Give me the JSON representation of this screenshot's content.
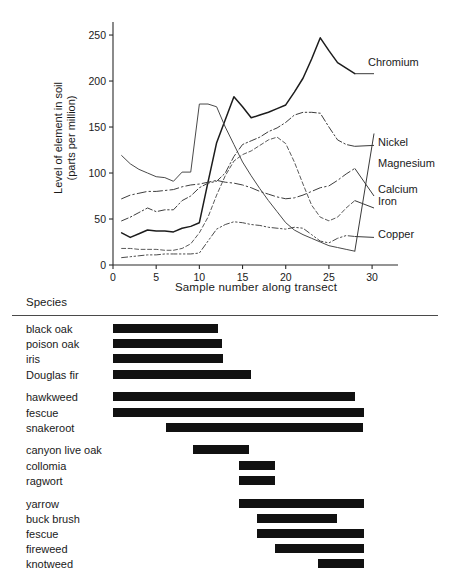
{
  "chart_data": [
    {
      "type": "line",
      "title": "",
      "xlabel": "Sample  number along transect",
      "ylabel": "Level of element in soil (parts per million)",
      "ylabel_line1": "Level of element in soil",
      "ylabel_line2": "(parts per million)",
      "xlim": [
        0,
        33
      ],
      "ylim": [
        0,
        262
      ],
      "xticks": [
        0,
        5,
        10,
        15,
        20,
        25,
        30
      ],
      "yticks": [
        0,
        50,
        100,
        150,
        200,
        250
      ],
      "grid": false,
      "legend_position": "right-inline-labels",
      "x": [
        1,
        2,
        3,
        4,
        5,
        6,
        7,
        8,
        9,
        10,
        11,
        12,
        13,
        14,
        15,
        16,
        17,
        18,
        19,
        20,
        21,
        22,
        23,
        24,
        25,
        26,
        27,
        28
      ],
      "series": [
        {
          "name": "Chromium",
          "line_style": "solid",
          "label_x": 28,
          "label_y": 208,
          "values": [
            35,
            30,
            34,
            38,
            37,
            37,
            36,
            40,
            42,
            46,
            90,
            133,
            158,
            183,
            172,
            160,
            163,
            166,
            170,
            174,
            188,
            203,
            224,
            247,
            233,
            220,
            214,
            208
          ]
        },
        {
          "name": "Nickel",
          "line_style": "solid",
          "label_x": 28,
          "label_y": 143,
          "values": [
            119,
            110,
            104,
            100,
            96,
            95,
            91,
            101,
            101,
            175,
            175,
            172,
            150,
            131,
            112,
            97,
            83,
            70,
            58,
            46,
            38,
            33,
            29,
            25,
            21,
            19,
            17,
            15
          ]
        },
        {
          "name": "Magnesium",
          "line_style": "dash-dot",
          "label_x": 28,
          "label_y": 130,
          "values": [
            48,
            52,
            57,
            62,
            58,
            60,
            60,
            70,
            75,
            84,
            89,
            91,
            100,
            118,
            131,
            135,
            139,
            145,
            149,
            155,
            163,
            166,
            166,
            165,
            150,
            136,
            131,
            129
          ]
        },
        {
          "name": "Calcium",
          "line_style": "long-dash-dot",
          "label_x": 28,
          "label_y": 75,
          "values": [
            72,
            76,
            78,
            80,
            80,
            81,
            82,
            85,
            87,
            88,
            90,
            92,
            90,
            89,
            87,
            84,
            80,
            77,
            74,
            72,
            73,
            76,
            80,
            84,
            86,
            92,
            99,
            105
          ]
        },
        {
          "name": "Iron",
          "line_style": "dashed",
          "label_x": 28,
          "label_y": 62,
          "values": [
            18,
            18,
            17,
            17,
            17,
            16,
            16,
            18,
            23,
            35,
            52,
            76,
            97,
            113,
            120,
            124,
            130,
            136,
            139,
            132,
            112,
            88,
            65,
            52,
            48,
            52,
            62,
            70
          ]
        },
        {
          "name": "Copper",
          "line_style": "dash-dot-dot",
          "label_x": 28,
          "label_y": 30,
          "values": [
            8,
            9,
            10,
            11,
            11,
            12,
            12,
            12,
            12,
            13,
            26,
            39,
            44,
            47,
            46,
            44,
            43,
            41,
            40,
            39,
            41,
            40,
            33,
            26,
            24,
            29,
            32,
            31
          ]
        }
      ]
    },
    {
      "type": "bar",
      "orientation": "horizontal-range",
      "title": "Species",
      "xlabel": "",
      "ylabel": "",
      "xlim": [
        0,
        33
      ],
      "note": "Each bar spans the sample-number range along the transect where the species occurs.",
      "categories": [
        "black oak",
        "poison oak",
        "iris",
        "Douglas fir",
        "hawkweed",
        "fescue",
        "snakeroot",
        "canyon live oak",
        "collomia",
        "ragwort",
        "yarrow",
        "buck brush",
        "fescue",
        "fireweed",
        "knotweed"
      ],
      "ranges": [
        [
          0.0,
          12.2
        ],
        [
          0.0,
          12.6
        ],
        [
          0.0,
          12.7
        ],
        [
          0.0,
          16.0
        ],
        [
          0.0,
          28.0
        ],
        [
          0.0,
          29.0
        ],
        [
          6.1,
          29.0
        ],
        [
          9.2,
          15.7
        ],
        [
          14.6,
          18.8
        ],
        [
          14.6,
          18.8
        ],
        [
          14.6,
          29.1
        ],
        [
          16.7,
          26.0
        ],
        [
          16.7,
          29.1
        ],
        [
          18.8,
          29.1
        ],
        [
          23.7,
          29.1
        ]
      ],
      "groups": [
        {
          "label": "group-1",
          "rows": [
            0,
            1,
            2,
            3
          ]
        },
        {
          "label": "group-2",
          "rows": [
            4,
            5,
            6
          ]
        },
        {
          "label": "group-3",
          "rows": [
            7,
            8,
            9
          ]
        },
        {
          "label": "group-4",
          "rows": [
            10,
            11,
            12,
            13,
            14
          ]
        }
      ]
    }
  ],
  "chart": {
    "ylabel_line1": "Level of element in soil",
    "ylabel_line2": "(parts per million)",
    "xlabel": "Sample  number along transect",
    "yticks": [
      "0",
      "50",
      "100",
      "150",
      "200",
      "250"
    ],
    "xticks": [
      "0",
      "5",
      "10",
      "15",
      "20",
      "25",
      "30"
    ],
    "labels": {
      "chromium": "Chromium",
      "nickel": "Nickel",
      "magnesium": "Magnesium",
      "calcium": "Calcium",
      "iron": "Iron",
      "copper": "Copper"
    }
  },
  "species": {
    "heading": "Species",
    "rows": [
      {
        "name": "black oak"
      },
      {
        "name": "poison oak"
      },
      {
        "name": "iris"
      },
      {
        "name": "Douglas fir"
      },
      {
        "name": "hawkweed"
      },
      {
        "name": "fescue"
      },
      {
        "name": "snakeroot"
      },
      {
        "name": "canyon live oak"
      },
      {
        "name": "collomia"
      },
      {
        "name": "ragwort"
      },
      {
        "name": "yarrow"
      },
      {
        "name": "buck brush"
      },
      {
        "name": "fescue"
      },
      {
        "name": "fireweed"
      },
      {
        "name": "knotweed"
      }
    ]
  },
  "colors": {
    "ink": "#1a1a1a",
    "bar": "#111111",
    "rule": "#4a4a4a"
  }
}
